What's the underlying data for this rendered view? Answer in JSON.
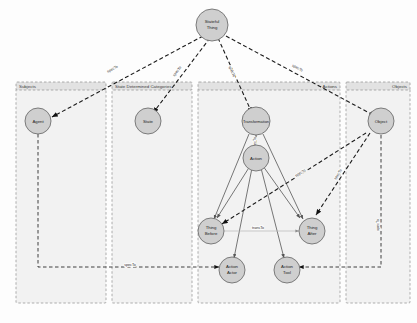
{
  "diagram": {
    "background_color": "#fdfdfd",
    "group_fill": "#f2f2f2",
    "group_header_fill": "#e2e2e2",
    "group_border_color": "#9a9a9a",
    "node_fill": "#cfcfcf",
    "node_border_color": "#6f6f6f",
    "edge_color": "#1a1a1a",
    "groups": [
      {
        "id": "subjects",
        "label": "Subjects"
      },
      {
        "id": "state-determined-categories",
        "label": "State Determined Categories"
      },
      {
        "id": "actions",
        "label": "Actions"
      },
      {
        "id": "objects",
        "label": "Objects"
      }
    ],
    "nodes": [
      {
        "id": "stateful-thing",
        "label_line1": "Stateful",
        "label_line2": "Thing"
      },
      {
        "id": "agent",
        "label_line1": "Agent",
        "label_line2": ""
      },
      {
        "id": "state",
        "label_line1": "State",
        "label_line2": ""
      },
      {
        "id": "transformation",
        "label_line1": "Transformation",
        "label_line2": ""
      },
      {
        "id": "object",
        "label_line1": "Object",
        "label_line2": ""
      },
      {
        "id": "action",
        "label_line1": "Action",
        "label_line2": ""
      },
      {
        "id": "thing-before",
        "label_line1": "Thing",
        "label_line2": "Before"
      },
      {
        "id": "thing-after",
        "label_line1": "Thing",
        "label_line2": "After"
      },
      {
        "id": "action-actor",
        "label_line1": "Action",
        "label_line2": "Actor"
      },
      {
        "id": "action-tool",
        "label_line1": "Action",
        "label_line2": "Tool"
      }
    ],
    "edges": [
      {
        "id": "stateful-thing-to-agent",
        "from": "stateful-thing",
        "to": "agent",
        "label": "specTo",
        "style": "dashed"
      },
      {
        "id": "stateful-thing-to-state",
        "from": "stateful-thing",
        "to": "state",
        "label": "specTo",
        "style": "dashed"
      },
      {
        "id": "stateful-thing-to-transformation",
        "from": "stateful-thing",
        "to": "transformation",
        "label": "specTo",
        "style": "dashed"
      },
      {
        "id": "stateful-thing-to-object",
        "from": "stateful-thing",
        "to": "object",
        "label": "specTo",
        "style": "dashed"
      },
      {
        "id": "transformation-to-action",
        "from": "transformation",
        "to": "action",
        "label": "specTo",
        "style": "dashed"
      },
      {
        "id": "transformation-to-thing-before",
        "from": "transformation",
        "to": "thing-before",
        "label": "",
        "style": "solid"
      },
      {
        "id": "transformation-to-thing-after",
        "from": "transformation",
        "to": "thing-after",
        "label": "",
        "style": "solid"
      },
      {
        "id": "action-to-thing-before",
        "from": "action",
        "to": "thing-before",
        "label": "",
        "style": "solid"
      },
      {
        "id": "action-to-thing-after",
        "from": "action",
        "to": "thing-after",
        "label": "",
        "style": "solid"
      },
      {
        "id": "action-to-action-actor",
        "from": "action",
        "to": "action-actor",
        "label": "",
        "style": "solid"
      },
      {
        "id": "action-to-action-tool",
        "from": "action",
        "to": "action-tool",
        "label": "",
        "style": "solid"
      },
      {
        "id": "thing-before-to-thing-after",
        "from": "thing-before",
        "to": "thing-after",
        "label": "transTo",
        "style": "faint"
      },
      {
        "id": "object-to-thing-before",
        "from": "object",
        "to": "thing-before",
        "label": "specTo",
        "style": "dashed"
      },
      {
        "id": "object-to-thing-after",
        "from": "object",
        "to": "thing-after",
        "label": "specTo",
        "style": "dashed"
      },
      {
        "id": "object-to-action-tool",
        "from": "object",
        "to": "action-tool",
        "label": "specTo",
        "style": "dashed"
      },
      {
        "id": "agent-to-action-actor",
        "from": "agent",
        "to": "action-actor",
        "label": "specTo",
        "style": "dashed"
      }
    ]
  }
}
